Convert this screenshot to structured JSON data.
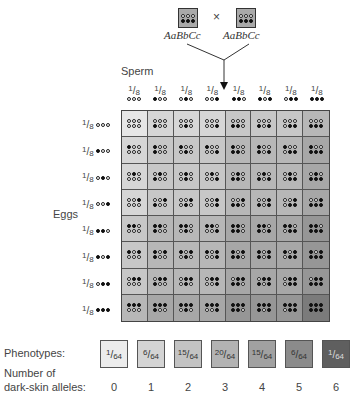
{
  "parents": {
    "left": {
      "genotype": "AaBbCc",
      "top": [
        "w",
        "w",
        "w"
      ],
      "bottom": [
        "b",
        "b",
        "b"
      ]
    },
    "cross_symbol": "×",
    "right": {
      "genotype": "AaBbCc",
      "top": [
        "w",
        "w",
        "w"
      ],
      "bottom": [
        "b",
        "b",
        "b"
      ]
    }
  },
  "labels": {
    "sperm": "Sperm",
    "eggs": "Eggs",
    "phenotypes": "Phenotypes:",
    "alleles_line1": "Number of",
    "alleles_line2": "dark-skin alleles:"
  },
  "gamete_fraction": {
    "num": "1",
    "den": "8"
  },
  "gametes": [
    [
      "w",
      "w",
      "w"
    ],
    [
      "b",
      "w",
      "w"
    ],
    [
      "w",
      "b",
      "w"
    ],
    [
      "w",
      "w",
      "b"
    ],
    [
      "b",
      "b",
      "w"
    ],
    [
      "b",
      "w",
      "b"
    ],
    [
      "w",
      "b",
      "b"
    ],
    [
      "b",
      "b",
      "b"
    ]
  ],
  "cell_shades": [
    "#e6e6e6",
    "#d6d6d6",
    "#c7c7c7",
    "#b7b7b7",
    "#a7a7a7",
    "#969696",
    "#7b7b7b"
  ],
  "phenotypes": [
    {
      "num": "1",
      "den": "64",
      "alleles": "0",
      "color": "#ececec",
      "text_color": "#333"
    },
    {
      "num": "6",
      "den": "64",
      "alleles": "1",
      "color": "#d4d4d4",
      "text_color": "#333"
    },
    {
      "num": "15",
      "den": "64",
      "alleles": "2",
      "color": "#c3c3c3",
      "text_color": "#333"
    },
    {
      "num": "20",
      "den": "64",
      "alleles": "3",
      "color": "#b3b3b3",
      "text_color": "#333"
    },
    {
      "num": "15",
      "den": "64",
      "alleles": "4",
      "color": "#a1a1a1",
      "text_color": "#333"
    },
    {
      "num": "6",
      "den": "64",
      "alleles": "5",
      "color": "#8b8b8b",
      "text_color": "#333"
    },
    {
      "num": "1",
      "den": "64",
      "alleles": "6",
      "color": "#5f5f5f",
      "text_color": "#ddd"
    }
  ]
}
